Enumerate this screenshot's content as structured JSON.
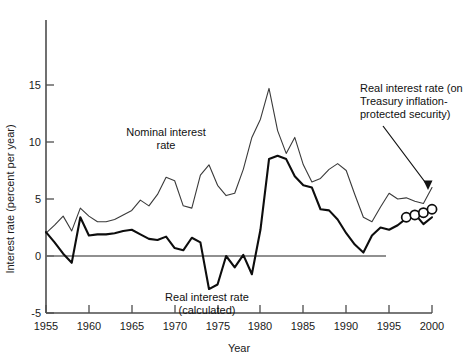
{
  "chart_data": {
    "type": "line",
    "title": "",
    "xlabel": "Year",
    "ylabel": "Interest rate (percent per year)",
    "xlim": [
      1955,
      2000
    ],
    "ylim": [
      -5,
      15
    ],
    "xticks": [
      1955,
      1960,
      1965,
      1970,
      1975,
      1980,
      1985,
      1990,
      1995,
      2000
    ],
    "yticks": [
      -5,
      0,
      5,
      10,
      15
    ],
    "xtick_labels": [
      "1955",
      "1960",
      "1965",
      "1970",
      "1975",
      "1980",
      "1985",
      "1990",
      "1995",
      "2000"
    ],
    "ytick_labels": [
      "-5",
      "0",
      "5",
      "10",
      "15"
    ],
    "grid": false,
    "legend": "inline-annotations",
    "zero_reference_line": 0,
    "series": [
      {
        "name": "Nominal interest rate",
        "label_text": "Nominal interest\nrate",
        "style": "thin-line",
        "x": [
          1955,
          1956,
          1957,
          1958,
          1959,
          1960,
          1961,
          1962,
          1963,
          1964,
          1965,
          1966,
          1967,
          1968,
          1969,
          1970,
          1971,
          1972,
          1973,
          1974,
          1975,
          1976,
          1977,
          1978,
          1979,
          1980,
          1981,
          1982,
          1983,
          1984,
          1985,
          1986,
          1987,
          1988,
          1989,
          1990,
          1991,
          1992,
          1993,
          1994,
          1995,
          1996,
          1997,
          1998,
          1999,
          2000
        ],
        "values": [
          2.0,
          2.7,
          3.5,
          2.2,
          4.2,
          3.5,
          3.0,
          3.0,
          3.2,
          3.6,
          4.0,
          4.9,
          4.4,
          5.4,
          6.9,
          6.6,
          4.4,
          4.2,
          7.1,
          8.0,
          6.2,
          5.3,
          5.5,
          7.6,
          10.4,
          12.0,
          14.7,
          11.0,
          9.0,
          10.4,
          8.0,
          6.5,
          6.8,
          7.6,
          8.1,
          7.5,
          5.4,
          3.4,
          3.0,
          4.3,
          5.5,
          5.0,
          5.1,
          4.8,
          4.6,
          6.0
        ]
      },
      {
        "name": "Real interest rate (calculated)",
        "label_text": "Real interest rate\n(calculated)",
        "style": "thick-line",
        "x": [
          1955,
          1956,
          1957,
          1958,
          1959,
          1960,
          1961,
          1962,
          1963,
          1964,
          1965,
          1966,
          1967,
          1968,
          1969,
          1970,
          1971,
          1972,
          1973,
          1974,
          1975,
          1976,
          1977,
          1978,
          1979,
          1980,
          1981,
          1982,
          1983,
          1984,
          1985,
          1986,
          1987,
          1988,
          1989,
          1990,
          1991,
          1992,
          1993,
          1994,
          1995,
          1996,
          1997,
          1998,
          1999,
          2000
        ],
        "values": [
          2.1,
          1.2,
          0.2,
          -0.6,
          3.4,
          1.8,
          1.9,
          1.9,
          2.0,
          2.2,
          2.3,
          1.9,
          1.5,
          1.4,
          1.7,
          0.7,
          0.5,
          1.6,
          1.2,
          -2.9,
          -2.5,
          0.0,
          -1.0,
          0.1,
          -1.6,
          2.3,
          8.5,
          8.8,
          8.5,
          7.0,
          6.2,
          6.0,
          4.1,
          4.0,
          3.2,
          2.0,
          1.0,
          0.3,
          1.8,
          2.5,
          2.3,
          2.7,
          3.3,
          3.7,
          2.8,
          3.4
        ]
      }
    ],
    "markers": {
      "name": "Real interest rate (on Treasury inflation-protected security)",
      "shape": "open-circle",
      "x": [
        1997,
        1998,
        1999,
        2000
      ],
      "values": [
        3.4,
        3.6,
        3.8,
        4.1
      ]
    },
    "annotations": [
      {
        "name": "nominal-rate-label",
        "lines": [
          "Nominal interest",
          "rate"
        ],
        "x": 1969,
        "y": 8.3
      },
      {
        "name": "real-rate-calculated-label",
        "lines": [
          "Real interest rate",
          "(calculated)"
        ],
        "x": 1976.5,
        "y": -3.9
      },
      {
        "name": "tips-label",
        "lines": [
          "Real interest rate (on",
          "Treasury inflation-",
          "protected security)"
        ],
        "x": 1999.5,
        "y": 11.5,
        "has_arrow": true
      }
    ],
    "colors": {
      "nominal_line": "#3a3a3a",
      "real_line": "#0d0d0d",
      "axis": "#4d4d4d",
      "zero_line": "#6b6b6b",
      "marker_fill": "#ffffff",
      "background": "#ffffff"
    }
  }
}
